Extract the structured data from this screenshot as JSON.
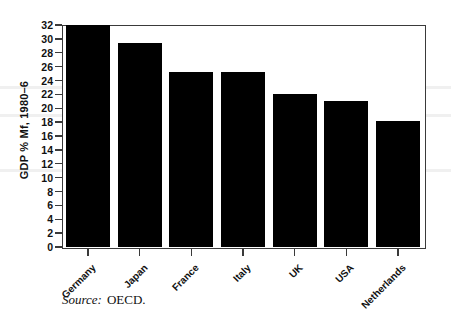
{
  "chart_data": {
    "type": "bar",
    "title": "",
    "subtitle": "",
    "xlabel": "",
    "ylabel": "GDP % Mf, 1980–6",
    "categories": [
      "Germany",
      "Japan",
      "France",
      "Italy",
      "UK",
      "USA",
      "Netherlands"
    ],
    "values": [
      32,
      29.4,
      25.2,
      25.2,
      22,
      21,
      18.2
    ],
    "ylim": [
      0,
      32
    ],
    "y_ticks": [
      0,
      2,
      4,
      6,
      8,
      10,
      12,
      14,
      16,
      18,
      20,
      22,
      24,
      26,
      28,
      30,
      32
    ],
    "y_tick_labels": [
      "0",
      "2",
      "4",
      "6",
      "8",
      "10",
      "12",
      "14",
      "16",
      "18",
      "20",
      "22",
      "24",
      "26",
      "28",
      "30",
      "32"
    ],
    "grid": false,
    "legend": null,
    "legend_position": "none",
    "bar_color": "#000000",
    "axis_color": "#3a3a3a",
    "background_color": "#ffffff"
  },
  "source": {
    "label": "Source:",
    "value": "OECD."
  }
}
